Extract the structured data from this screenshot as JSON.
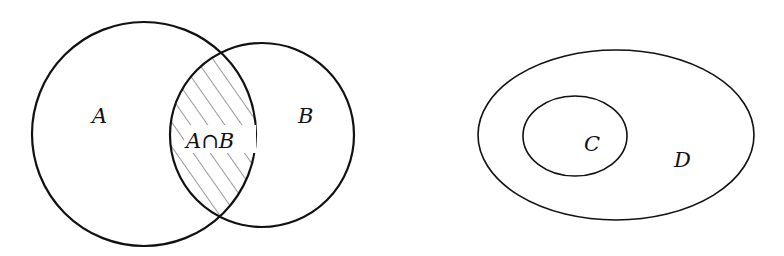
{
  "diagrams": [
    {
      "title": "Intersection of sets",
      "sets": [
        {
          "label": "A",
          "shape": "circle",
          "cx": 144,
          "cy": 134,
          "r": 112
        },
        {
          "label": "B",
          "shape": "circle",
          "cx": 262,
          "cy": 135,
          "r": 92
        }
      ],
      "region": {
        "label": "A∩B",
        "shading": "diagonal-hatch"
      }
    },
    {
      "title": "Subset",
      "sets": [
        {
          "label": "C",
          "shape": "ellipse",
          "cx": 575,
          "cy": 136,
          "rx": 52,
          "ry": 40
        },
        {
          "label": "D",
          "shape": "ellipse",
          "cx": 616,
          "cy": 135,
          "rx": 138,
          "ry": 85
        }
      ]
    }
  ],
  "labels": {
    "a": "A",
    "b": "B",
    "ab": "A∩B",
    "c": "C",
    "d": "D"
  },
  "colors": {
    "stroke": "#111111",
    "hatch": "#333333",
    "background": "#ffffff"
  }
}
